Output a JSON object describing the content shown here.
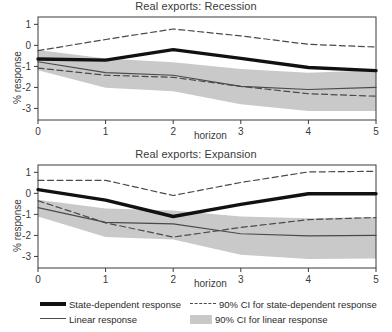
{
  "figure": {
    "width": 392,
    "height": 332,
    "background": "#ffffff"
  },
  "axis_label": {
    "y": "% response",
    "x": "horizon"
  },
  "legend": {
    "items": [
      {
        "key": "state-dependent",
        "label": "State-dependent response",
        "swatch": "thick-solid-line",
        "color": "#111111"
      },
      {
        "key": "linear",
        "label": "Linear response",
        "swatch": "thin-solid-line",
        "color": "#4a4a4a"
      },
      {
        "key": "ci-state",
        "label": "90% CI for state-dependent response",
        "swatch": "dashed-line",
        "color": "#4a4a4a"
      },
      {
        "key": "ci-linear",
        "label": "90% CI for linear response",
        "swatch": "gray-band",
        "color": "#c9c9c9"
      }
    ]
  },
  "colors": {
    "state_dependent": "#111111",
    "linear": "#4a4a4a",
    "ci_dashed": "#4a4a4a",
    "ci_band": "#c9c9c9",
    "axis": "#3a3a3a",
    "text": "#2b2b2b"
  },
  "chart_data": [
    {
      "type": "line",
      "id": "recession",
      "title": "Real exports: Recession",
      "xlabel": "horizon",
      "ylabel": "% response",
      "x": [
        0,
        1,
        2,
        3,
        4,
        5
      ],
      "xticks": [
        0,
        1,
        2,
        3,
        4,
        5
      ],
      "xticklabels": [
        "0",
        "1",
        "2",
        "3",
        "4",
        "5"
      ],
      "yticks": [
        1,
        0,
        -1,
        -2,
        -3
      ],
      "yticklabels": [
        "1",
        "0",
        "-1",
        "-2",
        "-3"
      ],
      "xlim": [
        0,
        5
      ],
      "ylim": [
        -3.55,
        1.35
      ],
      "grid": false,
      "legend_position": "below-figure",
      "series": [
        {
          "name": "State-dependent response",
          "style": "thick-solid",
          "values": [
            -0.65,
            -0.7,
            -0.2,
            -0.62,
            -1.05,
            -1.2
          ]
        },
        {
          "name": "Linear response",
          "style": "thin-solid",
          "values": [
            -0.78,
            -1.3,
            -1.42,
            -1.95,
            -2.1,
            -2.0
          ]
        },
        {
          "name": "90% CI for state-dependent response (upper)",
          "style": "dashed",
          "values": [
            -0.25,
            0.28,
            0.78,
            0.45,
            0.05,
            -0.08
          ]
        },
        {
          "name": "90% CI for state-dependent response (lower)",
          "style": "dashed",
          "values": [
            -1.08,
            -1.42,
            -1.52,
            -1.95,
            -2.3,
            -2.42
          ]
        }
      ],
      "band": {
        "name": "90% CI for linear response",
        "upper": [
          -0.22,
          -0.62,
          -0.8,
          -1.12,
          -1.3,
          -1.18
        ],
        "lower": [
          -1.18,
          -2.02,
          -2.18,
          -2.8,
          -3.12,
          -3.12
        ]
      }
    },
    {
      "type": "line",
      "id": "expansion",
      "title": "Real exports: Expansion",
      "xlabel": "horizon",
      "ylabel": "% response",
      "x": [
        0,
        1,
        2,
        3,
        4,
        5
      ],
      "xticks": [
        0,
        1,
        2,
        3,
        4,
        5
      ],
      "xticklabels": [
        "0",
        "1",
        "2",
        "3",
        "4",
        "5"
      ],
      "yticks": [
        1,
        0,
        -1,
        -2,
        -3
      ],
      "yticklabels": [
        "1",
        "0",
        "-1",
        "-2",
        "-3"
      ],
      "xlim": [
        0,
        5
      ],
      "ylim": [
        -3.55,
        1.35
      ],
      "grid": false,
      "legend_position": "below-figure",
      "series": [
        {
          "name": "State-dependent response",
          "style": "thick-solid",
          "values": [
            0.18,
            -0.32,
            -1.1,
            -0.52,
            -0.02,
            -0.02
          ]
        },
        {
          "name": "Linear response",
          "style": "thin-solid",
          "values": [
            -0.68,
            -1.38,
            -1.45,
            -1.92,
            -2.02,
            -2.0
          ]
        },
        {
          "name": "90% CI for state-dependent response (upper)",
          "style": "dashed",
          "values": [
            0.62,
            0.62,
            -0.1,
            0.52,
            1.02,
            1.05
          ]
        },
        {
          "name": "90% CI for state-dependent response (lower)",
          "style": "dashed",
          "values": [
            -0.35,
            -1.4,
            -2.08,
            -1.62,
            -1.25,
            -1.15
          ]
        }
      ],
      "band": {
        "name": "90% CI for linear response",
        "upper": [
          -0.3,
          -0.72,
          -0.82,
          -1.1,
          -1.18,
          -1.12
        ],
        "lower": [
          -1.1,
          -2.08,
          -2.2,
          -2.92,
          -3.12,
          -3.1
        ]
      }
    }
  ]
}
